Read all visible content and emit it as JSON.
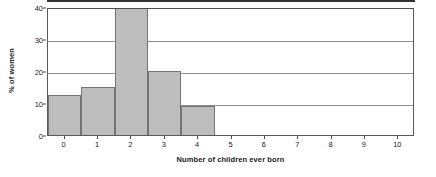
{
  "chart_data": {
    "type": "bar",
    "title": "",
    "subtitle": "",
    "xlabel": "Number of children ever born",
    "ylabel": "% of women",
    "categories": [
      "0",
      "1",
      "2",
      "3",
      "4",
      "5",
      "6",
      "7",
      "8",
      "9",
      "10"
    ],
    "values": [
      12.5,
      15,
      40,
      20,
      9,
      0,
      0,
      0,
      0,
      0,
      0
    ],
    "xlim": [
      -0.5,
      10.5
    ],
    "ylim": [
      0,
      40
    ],
    "y_ticks": [
      0,
      10,
      20,
      30,
      40
    ],
    "y_tick_labels": [
      "0",
      "10",
      "20",
      "30",
      "40"
    ],
    "x_ticks": [
      0,
      1,
      2,
      3,
      4,
      5,
      6,
      7,
      8,
      9,
      10
    ],
    "x_tick_labels": [
      "0",
      "1",
      "2",
      "3",
      "4",
      "5",
      "6",
      "7",
      "8",
      "9",
      "10"
    ],
    "grid": "horizontal",
    "legend": "none",
    "bar_fill_color": "#bdbdbd",
    "bar_border_color": "#737373",
    "gridline_color": "#8c8c8c",
    "axis_color": "#333333",
    "background_color": "#ffffff"
  }
}
